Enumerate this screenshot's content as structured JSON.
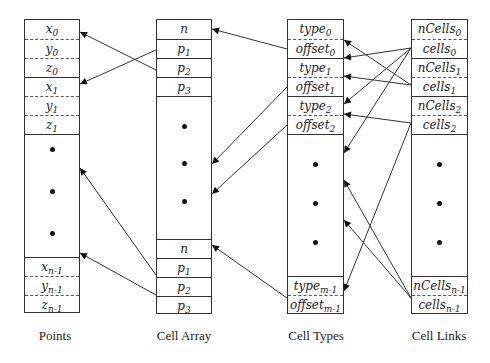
{
  "columns": [
    {
      "id": "points",
      "caption": "Points",
      "x": 24,
      "y": 19,
      "w": 56,
      "h": 294,
      "cells": [
        {
          "base": "x",
          "sub": "0",
          "top": 0,
          "sep": "none"
        },
        {
          "base": "y",
          "sub": "0",
          "top": 19,
          "sep": "dashed"
        },
        {
          "base": "z",
          "sub": "0",
          "top": 38,
          "sep": "dashed"
        },
        {
          "base": "x",
          "sub": "1",
          "top": 57,
          "sep": "solid"
        },
        {
          "base": "y",
          "sub": "1",
          "top": 76,
          "sep": "dashed"
        },
        {
          "base": "z",
          "sub": "1",
          "top": 95,
          "sep": "dashed"
        },
        {
          "base": "",
          "sub": "",
          "top": 114,
          "sep": "solid"
        },
        {
          "base": "x",
          "sub": "n-1",
          "top": 237,
          "sep": "solid"
        },
        {
          "base": "y",
          "sub": "n-1",
          "top": 256,
          "sep": "dashed"
        },
        {
          "base": "z",
          "sub": "n-1",
          "top": 275,
          "sep": "dashed"
        }
      ],
      "dots": [
        148,
        190,
        232
      ]
    },
    {
      "id": "cell-array",
      "caption": "Cell Array",
      "x": 156,
      "y": 19,
      "w": 56,
      "h": 295,
      "cells": [
        {
          "base": "n",
          "sub": "",
          "top": 0,
          "sep": "none"
        },
        {
          "base": "p",
          "sub": "1",
          "top": 19,
          "sep": "solid"
        },
        {
          "base": "p",
          "sub": "2",
          "top": 38,
          "sep": "solid"
        },
        {
          "base": "p",
          "sub": "3",
          "top": 57,
          "sep": "solid"
        },
        {
          "base": "",
          "sub": "",
          "top": 76,
          "sep": "solid"
        },
        {
          "base": "n",
          "sub": "",
          "top": 219,
          "sep": "solid"
        },
        {
          "base": "p",
          "sub": "1",
          "top": 238,
          "sep": "solid"
        },
        {
          "base": "p",
          "sub": "2",
          "top": 257,
          "sep": "solid"
        },
        {
          "base": "p",
          "sub": "3",
          "top": 276,
          "sep": "solid"
        }
      ],
      "dots": [
        125,
        162,
        200
      ]
    },
    {
      "id": "cell-types",
      "caption": "Cell Types",
      "x": 287,
      "y": 19,
      "w": 57,
      "h": 295,
      "cells": [
        {
          "base": "type",
          "sub": "0",
          "top": 0,
          "sep": "none"
        },
        {
          "base": "offset",
          "sub": "0",
          "top": 19,
          "sep": "dashed"
        },
        {
          "base": "type",
          "sub": "1",
          "top": 38,
          "sep": "solid"
        },
        {
          "base": "offset",
          "sub": "1",
          "top": 57,
          "sep": "dashed"
        },
        {
          "base": "type",
          "sub": "2",
          "top": 76,
          "sep": "solid"
        },
        {
          "base": "offset",
          "sub": "2",
          "top": 95,
          "sep": "dashed"
        },
        {
          "base": "",
          "sub": "",
          "top": 114,
          "sep": "solid"
        },
        {
          "base": "type",
          "sub": "m-1",
          "top": 256,
          "sep": "solid"
        },
        {
          "base": "offset",
          "sub": "m-1",
          "top": 275,
          "sep": "dashed"
        }
      ],
      "dots": [
        163,
        202,
        241
      ]
    },
    {
      "id": "cell-links",
      "caption": "Cell Links",
      "x": 411,
      "y": 19,
      "w": 57,
      "h": 295,
      "cells": [
        {
          "base": "nCells",
          "sub": "0",
          "top": 0,
          "sep": "none"
        },
        {
          "base": "cells",
          "sub": "0",
          "top": 19,
          "sep": "dashed"
        },
        {
          "base": "nCells",
          "sub": "1",
          "top": 38,
          "sep": "solid"
        },
        {
          "base": "cells",
          "sub": "1",
          "top": 57,
          "sep": "dashed"
        },
        {
          "base": "nCells",
          "sub": "2",
          "top": 76,
          "sep": "solid"
        },
        {
          "base": "cells",
          "sub": "2",
          "top": 95,
          "sep": "dashed"
        },
        {
          "base": "",
          "sub": "",
          "top": 114,
          "sep": "solid"
        },
        {
          "base": "nCells",
          "sub": "n-1",
          "top": 256,
          "sep": "solid"
        },
        {
          "base": "cells",
          "sub": "n-1",
          "top": 275,
          "sep": "dashed"
        }
      ],
      "dots": [
        163,
        202,
        241
      ]
    }
  ],
  "arrows": [
    {
      "from": [
        156,
        50
      ],
      "to": [
        80,
        84
      ],
      "label": "cell-array-p1-to-point-1"
    },
    {
      "from": [
        156,
        70
      ],
      "to": [
        80,
        32
      ],
      "label": "cell-array-p2-to-point-0",
      "via": [
        127,
        136
      ]
    },
    {
      "from": [
        156,
        275
      ],
      "to": [
        80,
        168
      ],
      "label": "cell-array-lower-p1-to-points-middle",
      "via": [
        127,
        136
      ]
    },
    {
      "from": [
        156,
        295
      ],
      "to": [
        80,
        253
      ],
      "label": "cell-array-lower-p2-to-points-lower"
    },
    {
      "from": [
        287,
        49
      ],
      "to": [
        212,
        29
      ],
      "label": "offset0-to-cell-array-n"
    },
    {
      "from": [
        287,
        87
      ],
      "to": [
        212,
        164
      ],
      "label": "offset1-to-cell-array-middle"
    },
    {
      "from": [
        287,
        125
      ],
      "to": [
        212,
        194
      ],
      "label": "offset2-to-cell-array-middle"
    },
    {
      "from": [
        287,
        298
      ],
      "to": [
        212,
        245
      ],
      "label": "offset-m-1-to-cell-array-lower-n"
    },
    {
      "from": [
        411,
        48
      ],
      "to": [
        344,
        58
      ],
      "label": "cells0-to-offset0-a"
    },
    {
      "from": [
        411,
        48
      ],
      "to": [
        344,
        104
      ],
      "label": "cells0-to-type2"
    },
    {
      "from": [
        411,
        48
      ],
      "to": [
        344,
        153
      ],
      "label": "cells0-to-cell-types-middle"
    },
    {
      "from": [
        411,
        85
      ],
      "to": [
        344,
        76
      ],
      "label": "cells1-to-offset1"
    },
    {
      "from": [
        411,
        85
      ],
      "to": [
        344,
        40
      ],
      "label": "cells1-to-offset0"
    },
    {
      "from": [
        411,
        123
      ],
      "to": [
        344,
        114
      ],
      "label": "cells2-to-offset2"
    },
    {
      "from": [
        411,
        123
      ],
      "to": [
        344,
        291
      ],
      "label": "cells2-to-type-m-1"
    },
    {
      "from": [
        411,
        298
      ],
      "to": [
        344,
        180
      ],
      "label": "cells-n-1-to-cell-types-middle-a"
    },
    {
      "from": [
        411,
        298
      ],
      "to": [
        344,
        220
      ],
      "label": "cells-n-1-to-cell-types-middle-b"
    }
  ],
  "colors": {
    "line": "#333333",
    "arrowhead": "#111111",
    "text": "#222222",
    "background": "#ffffff"
  }
}
